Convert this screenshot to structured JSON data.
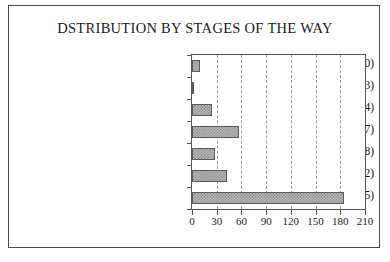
{
  "chart_data": {
    "type": "bar",
    "orientation": "horizontal",
    "title": "DSTRIBUTION BY STAGES OF THE WAY",
    "xlabel": "",
    "ylabel": "",
    "categories": [
      "Renewal of Baptismal Promises (10)",
      "Election (3)",
      "Our Father (24)",
      "Redditio Symboli (57)",
      "Initiation to Prayer (28)",
      "2nd Scrutiny (42)",
      "Up to Shema (185)"
    ],
    "values": [
      10,
      3,
      24,
      57,
      28,
      42,
      185
    ],
    "xlim": [
      0,
      210
    ],
    "xticks": [
      0,
      30,
      60,
      90,
      120,
      150,
      180,
      210
    ],
    "xticklabels": [
      "0",
      "30",
      "60",
      "90",
      "120",
      "150",
      "180",
      "210"
    ],
    "grid": "vertical-dashed",
    "legend": null,
    "bar_fill_color": "#b6b6b6",
    "bar_edge_color": "#5a5a5a",
    "gridline_color": "#9a9a9a",
    "axis_color": "#555555",
    "frame_color": "#4a4a4a",
    "text_color": "#111111",
    "background_color": "#ffffff"
  }
}
